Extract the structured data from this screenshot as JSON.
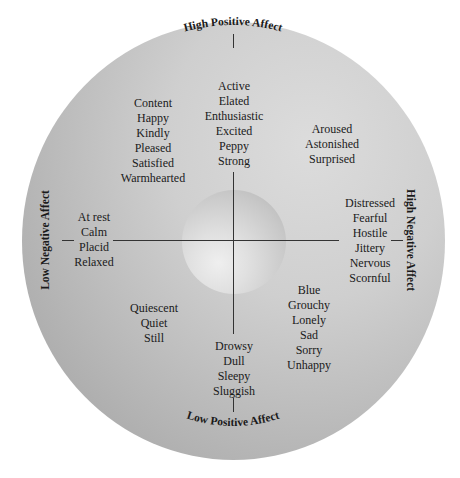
{
  "axes": {
    "top": "High Positive Affect",
    "bottom": "Low Positive Affect",
    "left": "Low Negative Affect",
    "right": "High Negative Affect"
  },
  "groups": {
    "top": [
      "Active",
      "Elated",
      "Enthusiastic",
      "Excited",
      "Peppy",
      "Strong"
    ],
    "top_left": [
      "Content",
      "Happy",
      "Kindly",
      "Pleased",
      "Satisfied",
      "Warmhearted"
    ],
    "top_right": [
      "Aroused",
      "Astonished",
      "Surprised"
    ],
    "left": [
      "At rest",
      "Calm",
      "Placid",
      "Relaxed"
    ],
    "right": [
      "Distressed",
      "Fearful",
      "Hostile",
      "Jittery",
      "Nervous",
      "Scornful"
    ],
    "bottom_left": [
      "Quiescent",
      "Quiet",
      "Still"
    ],
    "bottom": [
      "Drowsy",
      "Dull",
      "Sleepy",
      "Sluggish"
    ],
    "bottom_right": [
      "Blue",
      "Grouchy",
      "Lonely",
      "Sad",
      "Sorry",
      "Unhappy"
    ]
  },
  "colors": {
    "disc_light": "#dcdcdc",
    "disc_dark": "#9f9f9f",
    "line": "#333333",
    "text": "#1a1a1a"
  }
}
